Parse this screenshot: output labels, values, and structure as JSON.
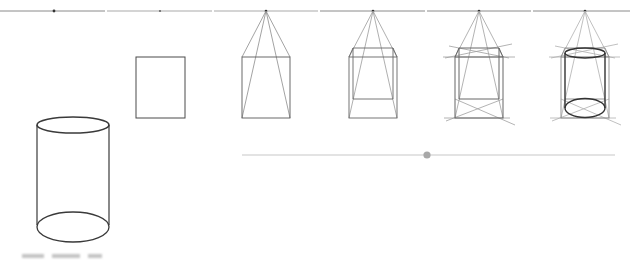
{
  "illustration": {
    "subject": "Drawing a cylinder in one-point perspective, step by step",
    "colors": {
      "background": "#ffffff",
      "horizon_line": "#8a8a8a",
      "vanishing_point": "#333333",
      "construction_line": "#9a9a9a",
      "outline": "#3a3a3a",
      "slider_track": "#c8c8c8",
      "slider_thumb": "#a8a8a8"
    },
    "horizon": {
      "y": 11,
      "segments": [
        [
          0,
          105
        ],
        [
          107,
          212
        ],
        [
          214,
          318
        ],
        [
          320,
          425
        ],
        [
          427,
          531
        ],
        [
          533,
          630
        ]
      ],
      "vanishing_points_x": [
        54,
        160,
        266,
        373,
        479,
        585
      ]
    },
    "panels": [
      {
        "name": "finished-cylinder",
        "step": 1
      },
      {
        "name": "front-rectangle",
        "step": 2
      },
      {
        "name": "vanishing-lines",
        "step": 3
      },
      {
        "name": "box-back-face",
        "step": 4
      },
      {
        "name": "face-diagonals",
        "step": 5
      },
      {
        "name": "ellipses-in-box",
        "step": 6
      }
    ],
    "slider": {
      "x_start": 242,
      "x_end": 615,
      "y": 155,
      "thumb_x": 427
    },
    "caption": {
      "visible_text": "",
      "note": "cut off at bottom edge, illegible"
    }
  }
}
